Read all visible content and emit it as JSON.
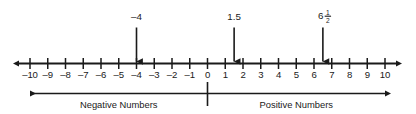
{
  "figure": {
    "ink_color": "#1a1a1a",
    "background_color": "#ffffff"
  },
  "chart_data": {
    "type": "number-line",
    "title": "",
    "xlabel": "",
    "ylabel": "",
    "xlim": [
      -10,
      10
    ],
    "grid": false,
    "legend_position": "none",
    "axis": {
      "min": -10,
      "max": 10,
      "tick_step": 1,
      "left_arrow": true,
      "right_arrow": true,
      "tick_values": [
        -10,
        -9,
        -8,
        -7,
        -6,
        -5,
        -4,
        -3,
        -2,
        -1,
        0,
        1,
        2,
        3,
        4,
        5,
        6,
        7,
        8,
        9,
        10
      ],
      "tick_labels": [
        "–10",
        "–9",
        "–8",
        "–7",
        "–6",
        "–5",
        "–4",
        "–3",
        "–2",
        "–1",
        "0",
        "1",
        "2",
        "3",
        "4",
        "5",
        "6",
        "7",
        "8",
        "9",
        "10"
      ]
    },
    "annotations": [
      {
        "label": "–4",
        "value": -4,
        "kind": "plain",
        "marker": "down-arrow"
      },
      {
        "label": "1.5",
        "value": 1.5,
        "kind": "plain",
        "marker": "down-arrow"
      },
      {
        "label": "6 1/2",
        "value": 6.5,
        "kind": "mixed-fraction",
        "whole": "6",
        "numerator": "1",
        "denominator": "2",
        "marker": "down-arrow"
      }
    ],
    "regions": [
      {
        "label": "Negative Numbers",
        "from": 0,
        "to": -10,
        "direction": "left",
        "label_at": -5
      },
      {
        "label": "Positive Numbers",
        "from": 0,
        "to": 10,
        "direction": "right",
        "label_at": 5
      }
    ],
    "divider": {
      "at": 0,
      "label": ""
    }
  }
}
